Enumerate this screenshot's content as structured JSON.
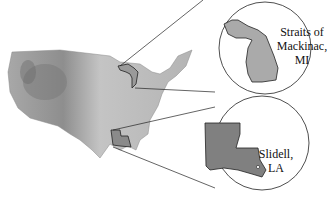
{
  "diagram": {
    "insets": [
      {
        "label_line1": "Straits of",
        "label_line2": "Mackinac,",
        "label_line3": "MI",
        "state": "Michigan"
      },
      {
        "label_line1": "Slidell,",
        "label_line2": "LA",
        "state": "Louisiana"
      }
    ],
    "colors": {
      "map_fill": "#b8b8b8",
      "state_fill": "#9a9a9a",
      "outline": "#222222",
      "background": "#ffffff"
    }
  }
}
